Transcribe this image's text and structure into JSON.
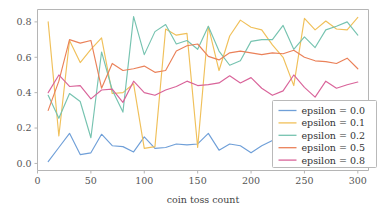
{
  "chart_data": {
    "type": "line",
    "title": "",
    "xlabel": "coin toss count",
    "ylabel": "",
    "xlim": [
      0,
      310
    ],
    "ylim": [
      -0.04,
      0.87
    ],
    "grid": false,
    "legend_position": "lower right",
    "xticks": [
      0,
      50,
      100,
      150,
      200,
      250,
      300
    ],
    "xticklabels": [
      "0",
      "50",
      "100",
      "150",
      "200",
      "250",
      "300"
    ],
    "yticks": [
      0.0,
      0.2,
      0.4,
      0.6,
      0.8
    ],
    "yticklabels": [
      "0.0",
      "0.2",
      "0.4",
      "0.6",
      "0.8"
    ],
    "x": [
      10,
      20,
      30,
      40,
      50,
      60,
      70,
      80,
      90,
      100,
      110,
      120,
      130,
      140,
      150,
      160,
      170,
      180,
      190,
      200,
      210,
      220,
      230,
      240,
      250,
      260,
      270,
      280,
      290,
      300
    ],
    "series": [
      {
        "name": "epsilon = 0.0",
        "color": "#6f9fd8",
        "values": [
          0.01,
          0.09,
          0.17,
          0.05,
          0.06,
          0.165,
          0.1,
          0.095,
          0.065,
          0.15,
          0.085,
          0.09,
          0.11,
          0.105,
          0.11,
          0.17,
          0.075,
          0.11,
          0.1,
          0.06,
          0.1,
          0.13,
          0.145,
          0.13,
          0.125,
          0.12,
          0.125,
          0.12,
          0.12,
          0.125
        ]
      },
      {
        "name": "epsilon = 0.1",
        "color": "#f0c05a",
        "values": [
          0.8,
          0.155,
          0.695,
          0.57,
          0.645,
          0.71,
          0.395,
          0.4,
          0.45,
          0.085,
          0.095,
          0.76,
          0.725,
          0.735,
          0.09,
          0.775,
          0.525,
          0.72,
          0.81,
          0.77,
          0.755,
          0.67,
          0.6,
          0.44,
          0.82,
          0.755,
          0.805,
          0.76,
          0.755,
          0.825
        ]
      },
      {
        "name": "epsilon = 0.2",
        "color": "#76c3b0"
      },
      {
        "name": "epsilon = 0.5",
        "color": "#ea8159"
      },
      {
        "name": "epsilon = 0.8",
        "color": "#d9649a"
      }
    ],
    "series_values": {
      "epsilon = 0.2": [
        0.385,
        0.255,
        0.395,
        0.35,
        0.145,
        0.63,
        0.415,
        0.29,
        0.83,
        0.615,
        0.745,
        0.785,
        0.675,
        0.695,
        0.645,
        0.775,
        0.635,
        0.555,
        0.58,
        0.69,
        0.7,
        0.7,
        0.78,
        0.645,
        0.715,
        0.655,
        0.755,
        0.775,
        0.8,
        0.725
      ],
      "epsilon = 0.5": [
        0.3,
        0.465,
        0.7,
        0.68,
        0.695,
        0.425,
        0.565,
        0.525,
        0.535,
        0.55,
        0.515,
        0.525,
        0.635,
        0.665,
        0.675,
        0.605,
        0.585,
        0.625,
        0.635,
        0.625,
        0.615,
        0.625,
        0.62,
        0.64,
        0.6,
        0.58,
        0.575,
        0.565,
        0.595,
        0.535
      ],
      "epsilon = 0.8": [
        0.4,
        0.5,
        0.435,
        0.44,
        0.365,
        0.415,
        0.42,
        0.345,
        0.465,
        0.4,
        0.385,
        0.415,
        0.435,
        0.465,
        0.44,
        0.445,
        0.455,
        0.495,
        0.455,
        0.485,
        0.425,
        0.385,
        0.41,
        0.5,
        0.43,
        0.375,
        0.465,
        0.425,
        0.445,
        0.46
      ]
    }
  },
  "legend": {
    "entries": [
      {
        "label": "epsilon = 0.0"
      },
      {
        "label": "epsilon = 0.1"
      },
      {
        "label": "epsilon = 0.2"
      },
      {
        "label": "epsilon = 0.5"
      },
      {
        "label": "epsilon = 0.8"
      }
    ]
  }
}
